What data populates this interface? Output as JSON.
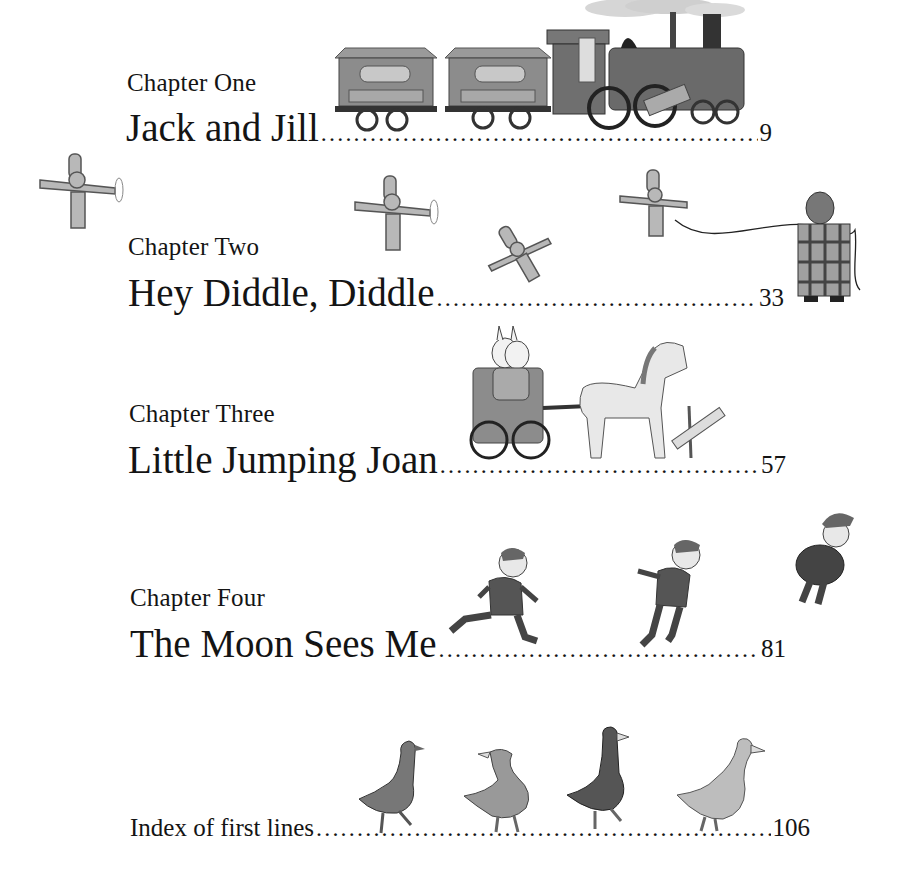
{
  "page": {
    "type": "table-of-contents",
    "background": "#ffffff",
    "text_color": "#141414"
  },
  "toc": {
    "chapters": [
      {
        "label": "Chapter One",
        "title": "Jack and Jill",
        "page": "9",
        "illustration": "train-icon"
      },
      {
        "label": "Chapter Two",
        "title": "Hey Diddle, Diddle",
        "page": "33",
        "illustration": "toy-airplanes-icon"
      },
      {
        "label": "Chapter Three",
        "title": "Little Jumping Joan",
        "page": "57",
        "illustration": "bunnies-pony-cart-icon"
      },
      {
        "label": "Chapter Four",
        "title": "The Moon Sees Me",
        "page": "81",
        "illustration": "running-boy-icon"
      }
    ],
    "index": {
      "title": "Index of first lines",
      "page": "106",
      "illustration": "geese-icon"
    },
    "leader": "......................................................................................................"
  }
}
